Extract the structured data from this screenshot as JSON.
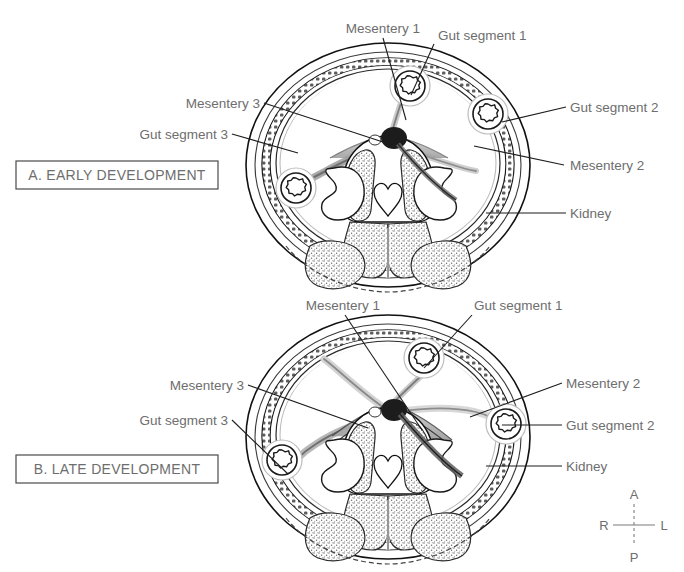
{
  "figure": {
    "background": "#ffffff",
    "label_color": "#6e6e6e",
    "leader_color": "#1d1d1d"
  },
  "panels": [
    {
      "id": "A",
      "title": "A. EARLY DEVELOPMENT",
      "labels": [
        {
          "key": "mesentery1",
          "text": "Mesentery 1",
          "anchor": "middle"
        },
        {
          "key": "gutsegment1",
          "text": "Gut segment 1",
          "anchor": "start"
        },
        {
          "key": "mesentery3",
          "text": "Mesentery 3",
          "anchor": "end"
        },
        {
          "key": "gutsegment3",
          "text": "Gut segment 3",
          "anchor": "end"
        },
        {
          "key": "gutsegment2",
          "text": "Gut segment 2",
          "anchor": "start"
        },
        {
          "key": "mesentery2",
          "text": "Mesentery 2",
          "anchor": "start"
        },
        {
          "key": "kidney",
          "text": "Kidney",
          "anchor": "start"
        }
      ]
    },
    {
      "id": "B",
      "title": "B. LATE DEVELOPMENT",
      "labels": [
        {
          "key": "mesentery1",
          "text": "Mesentery 1",
          "anchor": "middle"
        },
        {
          "key": "gutsegment1",
          "text": "Gut segment 1",
          "anchor": "start"
        },
        {
          "key": "mesentery3",
          "text": "Mesentery 3",
          "anchor": "end"
        },
        {
          "key": "gutsegment3",
          "text": "Gut segment 3",
          "anchor": "end"
        },
        {
          "key": "mesentery2",
          "text": "Mesentery 2",
          "anchor": "start"
        },
        {
          "key": "gutsegment2",
          "text": "Gut segment 2",
          "anchor": "start"
        },
        {
          "key": "kidney",
          "text": "Kidney",
          "anchor": "start"
        }
      ]
    }
  ],
  "compass": {
    "anterior": "A",
    "posterior": "P",
    "right": "R",
    "left": "L"
  }
}
